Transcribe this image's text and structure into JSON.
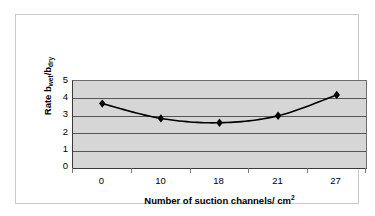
{
  "chart_data": {
    "type": "line",
    "title": "",
    "subtitle": "",
    "categories": [
      "0",
      "10",
      "18",
      "21",
      "27"
    ],
    "values": [
      3.7,
      2.85,
      2.6,
      3.0,
      4.2
    ],
    "series": [
      {
        "name": "Rate bwet/bdry",
        "values": [
          3.7,
          2.85,
          2.6,
          3.0,
          4.2
        ]
      }
    ],
    "xlabel_parts": {
      "main": "Number of suction channels/ cm",
      "superscript": "2"
    },
    "ylabel_parts": {
      "prefix": "Rate b",
      "sub1": "wet",
      "middle": "/b",
      "sub2": "dry"
    },
    "ylim": [
      0,
      5
    ],
    "yticks": [
      "5",
      "4",
      "3",
      "2",
      "1",
      "0"
    ],
    "xticks": [
      "0",
      "10",
      "18",
      "21",
      "27"
    ],
    "grid": "horizontal",
    "legend": "none",
    "marker": "diamond",
    "colors": {
      "plot_background": "#d6d6d6",
      "gridline": "#555555",
      "axis": "#3a3a3a",
      "series_line": "#000000",
      "marker_fill": "#000000",
      "page_background": "#ffffff",
      "frame_border": "#c9c9c9"
    }
  }
}
